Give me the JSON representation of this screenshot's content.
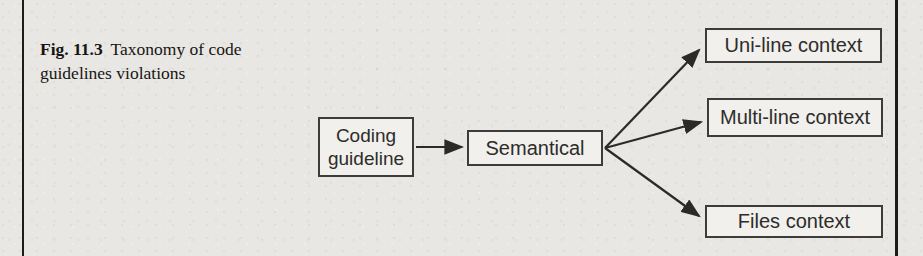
{
  "figure": {
    "label": "Fig. 11.3",
    "caption": "Taxonomy of code guidelines violations"
  },
  "diagram": {
    "nodes": {
      "coding_guideline": {
        "label": "Coding guideline"
      },
      "semantical": {
        "label": "Semantical"
      },
      "uni_line": {
        "label": "Uni-line context"
      },
      "multi_line": {
        "label": "Multi-line context"
      },
      "files": {
        "label": "Files context"
      }
    },
    "edges": [
      {
        "from": "Coding guideline",
        "to": "Semantical"
      },
      {
        "from": "Semantical",
        "to": "Uni-line context"
      },
      {
        "from": "Semantical",
        "to": "Multi-line context"
      },
      {
        "from": "Semantical",
        "to": "Files context"
      }
    ]
  },
  "colors": {
    "page_background": "#e9e7e3",
    "box_fill": "#f1f0ec",
    "box_border": "#3d3c3a",
    "arrow": "#2b2a28",
    "caption_text": "#161514",
    "frame_rule": "#1d1c1a"
  }
}
